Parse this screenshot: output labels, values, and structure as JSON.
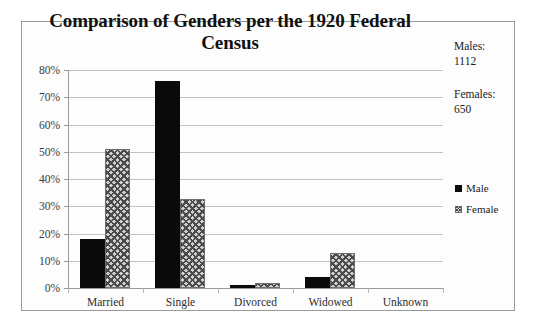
{
  "chart_data": {
    "type": "bar",
    "title": "Comparison of Genders per the 1920 Federal Census",
    "xlabel": "",
    "ylabel": "",
    "ylim": [
      0,
      80
    ],
    "ytick_labels": [
      "80%",
      "70%",
      "60%",
      "50%",
      "40%",
      "30%",
      "20%",
      "10%",
      "0%"
    ],
    "ytick_values": [
      80,
      70,
      60,
      50,
      40,
      30,
      20,
      10,
      0
    ],
    "categories": [
      "Married",
      "Single",
      "Divorced",
      "Widowed",
      "Unknown"
    ],
    "series": [
      {
        "name": "Male",
        "values": [
          18,
          76,
          1,
          4,
          0
        ]
      },
      {
        "name": "Female",
        "values": [
          51,
          32.5,
          2,
          13,
          0
        ]
      }
    ],
    "grid": true,
    "legend_position": "right",
    "value_unit": "percent"
  },
  "annotations": {
    "males_label": "Males:",
    "males_value": "1112",
    "females_label": "Females:",
    "females_value": "650"
  },
  "legend": {
    "items": [
      {
        "label": "Male",
        "swatch": "solid-black-square"
      },
      {
        "label": "Female",
        "swatch": "crosshatch-square"
      }
    ]
  },
  "colors": {
    "male_fill": "#0a0a0a",
    "female_fill": "#cfcfcf",
    "female_hatch": "#4b4b4b",
    "gridline": "#c2c2c2",
    "frame_border": "#9a9a9a",
    "text": "#1a1a1a",
    "background": "#ffffff"
  }
}
